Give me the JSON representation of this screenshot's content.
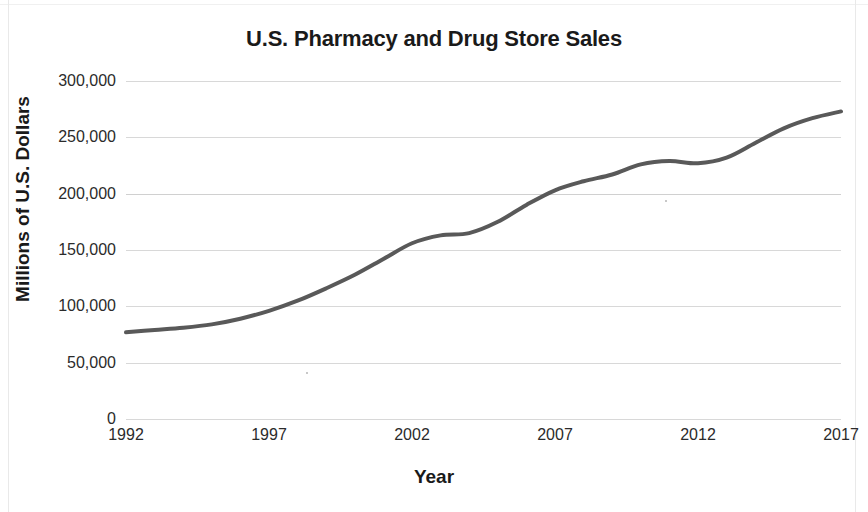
{
  "chart_data": {
    "type": "line",
    "title": "U.S. Pharmacy and Drug Store Sales",
    "xlabel": "Year",
    "ylabel": "Millions of U.S. Dollars",
    "xlim": [
      1992,
      2017
    ],
    "ylim": [
      0,
      300000
    ],
    "grid": true,
    "legend": "none",
    "line_color": "#595959",
    "line_width_px": 4,
    "x_tick_labels": [
      "1992",
      "1997",
      "2002",
      "2007",
      "2012",
      "2017"
    ],
    "x_ticks": [
      1992,
      1997,
      2002,
      2007,
      2012,
      2017
    ],
    "y_tick_labels": [
      "0",
      "50,000",
      "100,000",
      "150,000",
      "200,000",
      "250,000",
      "300,000"
    ],
    "y_ticks": [
      0,
      50000,
      100000,
      150000,
      200000,
      250000,
      300000
    ],
    "series": [
      {
        "name": "U.S. Pharmacy and Drug Store Sales",
        "x": [
          1992,
          1993,
          1994,
          1995,
          1996,
          1997,
          1998,
          1999,
          2000,
          2001,
          2002,
          2003,
          2004,
          2005,
          2006,
          2007,
          2008,
          2009,
          2010,
          2011,
          2012,
          2013,
          2014,
          2015,
          2016,
          2017
        ],
        "values": [
          77000,
          79000,
          81000,
          84000,
          89000,
          96000,
          105000,
          116000,
          128000,
          142000,
          156000,
          163000,
          165000,
          175000,
          190000,
          203000,
          211000,
          217000,
          226000,
          229000,
          227000,
          232000,
          245000,
          258000,
          267000,
          273000
        ]
      }
    ]
  }
}
